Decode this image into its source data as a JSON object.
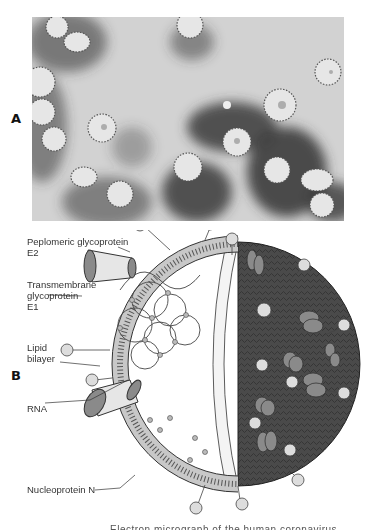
{
  "figure": {
    "panels": [
      {
        "letter": "A",
        "description": "Electron micrograph of coronavirus particles with crown-like surface projections"
      },
      {
        "letter": "B",
        "description": "Schematic cutaway diagram of a coronavirus virion"
      }
    ],
    "labels": {
      "e2_line1": "Peplomeric glycoprotein",
      "e2_line2": "E2",
      "e1_line1": "Transmembrane",
      "e1_line2": "glycoprotein",
      "e1_line3": "E1",
      "lipid_line1": "Lipid",
      "lipid_line2": "bilayer",
      "rna": "RNA",
      "nucleoprotein": "Nucleoprotein N"
    },
    "caption_partial": "Electron micrograph of the human coronavirus"
  },
  "colors": {
    "micrograph_bg": "#d2d2d2",
    "particle_fill": "#e6e6e6",
    "stain_dark": "#3a3a3a",
    "envelope_dark": "#4a4a4a",
    "membrane_light": "#c8c8c8",
    "protein_mid": "#8a8a8a",
    "knob_light": "#dddddd"
  }
}
